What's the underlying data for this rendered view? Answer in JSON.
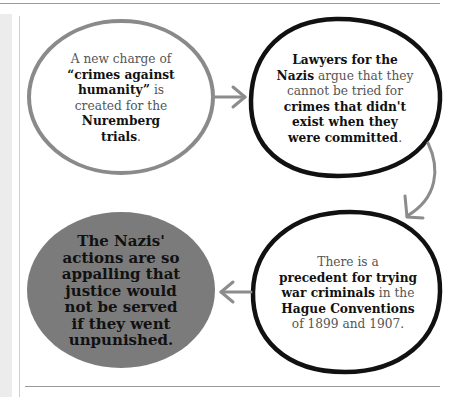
{
  "diagram": {
    "type": "flow",
    "nodes": [
      {
        "id": "charge",
        "style": "gray-outline",
        "segments": [
          {
            "text": "A new charge of ",
            "bold": false
          },
          {
            "text": "“crimes against humanity”",
            "bold": true
          },
          {
            "text": " is created for the ",
            "bold": false
          },
          {
            "text": "Nuremberg trials",
            "bold": true
          },
          {
            "text": ".",
            "bold": false
          }
        ],
        "lines": [
          "A new charge of",
          "“crimes against",
          "humanity” is",
          "created for the",
          "Nuremberg",
          "trials."
        ]
      },
      {
        "id": "lawyers",
        "style": "black-outline",
        "segments": [
          {
            "text": "Lawyers for the Nazis",
            "bold": true
          },
          {
            "text": " argue that they cannot be tried for ",
            "bold": false
          },
          {
            "text": "crimes that didn't exist when they were committed",
            "bold": true
          },
          {
            "text": ".",
            "bold": false
          }
        ],
        "lines": [
          "Lawyers for the",
          "Nazis argue that they",
          "cannot be tried for",
          "crimes that didn't",
          "exist when they",
          "were committed."
        ]
      },
      {
        "id": "precedent",
        "style": "black-outline",
        "segments": [
          {
            "text": "There is a ",
            "bold": false
          },
          {
            "text": "precedent for trying war criminals",
            "bold": true
          },
          {
            "text": " in the ",
            "bold": false
          },
          {
            "text": "Hague Conventions",
            "bold": true
          },
          {
            "text": " of 1899 and 1907.",
            "bold": false
          }
        ],
        "lines": [
          "There is a",
          "precedent for trying",
          "war criminals in the",
          "Hague Conventions",
          "of 1899 and 1907."
        ]
      },
      {
        "id": "justice",
        "style": "gray-filled",
        "lines": [
          "The Nazis'",
          "actions are so",
          "appalling that",
          "justice would",
          "not be served",
          "if they went",
          "unpunished."
        ]
      }
    ],
    "edges": [
      {
        "from": "charge",
        "to": "lawyers",
        "direction": "right"
      },
      {
        "from": "lawyers",
        "to": "precedent",
        "direction": "curved-down"
      },
      {
        "from": "precedent",
        "to": "justice",
        "direction": "left"
      }
    ],
    "colors": {
      "gray_outline": "#8a8a8a",
      "black_outline": "#111111",
      "filled_gray": "#7b7b7b",
      "arrow": "#8c8c8c",
      "body_text": "#555555",
      "bold_text": "#111111"
    }
  }
}
